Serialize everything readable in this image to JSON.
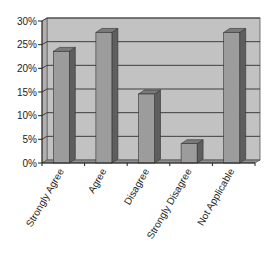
{
  "chart_data": {
    "type": "bar",
    "style": "3d-column",
    "title": "",
    "xlabel": "",
    "ylabel": "",
    "categories": [
      "Strongly Agree",
      "Agree",
      "Disagree",
      "Strongly Disagree",
      "Not Applicable"
    ],
    "values": [
      24,
      28,
      15,
      4.5,
      28
    ],
    "value_unit": "%",
    "ylim": [
      0,
      30
    ],
    "yticks": [
      "0%",
      "5%",
      "10%",
      "15%",
      "20%",
      "25%",
      "30%"
    ],
    "grid": true,
    "legend": null,
    "colors": {
      "bar_front": "#9c9c9c",
      "bar_side": "#5e5e5e",
      "bar_top": "#7a7a7a",
      "wall": "#c2c2c2",
      "floor": "#8e8e8e",
      "gridline": "#3e3e3e"
    }
  }
}
